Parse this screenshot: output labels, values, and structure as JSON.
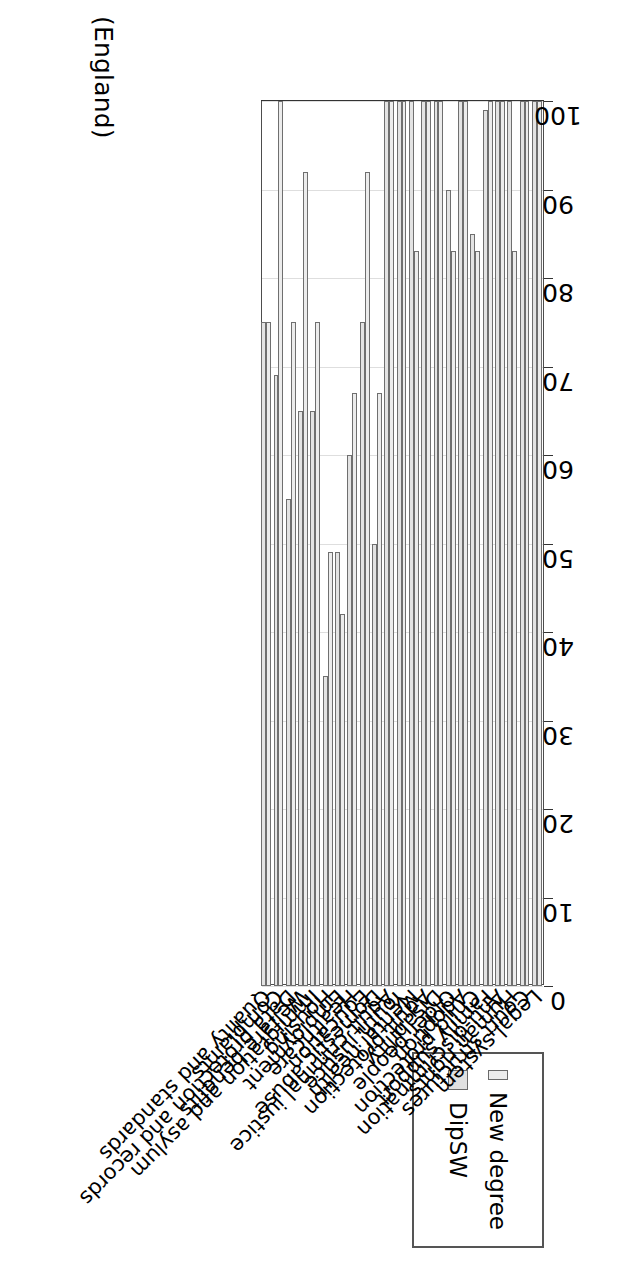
{
  "caption": "(England)",
  "legend": {
    "title": "",
    "items": [
      {
        "label": "New degree",
        "color": "#ececec"
      },
      {
        "label": "DipSW",
        "color": "#e0e0e0"
      }
    ]
  },
  "axis": {
    "tick_labels": [
      "100",
      "90",
      "80",
      "70",
      "60",
      "50",
      "40",
      "30",
      "20",
      "10",
      "0"
    ]
  },
  "chart_data": {
    "type": "bar",
    "orientation": "horizontal",
    "title": "",
    "subtitle": "(England)",
    "xlabel": "",
    "ylabel": "",
    "xlim": [
      0,
      100
    ],
    "grid": true,
    "legend_position": "top-right",
    "categories": [
      "Legal system",
      "Court structures",
      "Human rights",
      "Anti-discrimination",
      "Family support",
      "Child protection",
      "Adoption",
      "Older people",
      "Disability",
      "Adult protection",
      "Mental health",
      "Youth justice",
      "Adult criminal justice",
      "Domestic abuse",
      "Education",
      "Healthcare",
      "Employment",
      "Housing",
      "Immigration and asylum",
      "Welfare benefits",
      "Data protection and records",
      "Complaints",
      "Quality and standards"
    ],
    "series": [
      {
        "name": "New degree",
        "values": [
          100,
          100,
          83,
          100,
          100,
          83,
          100,
          83,
          100,
          100,
          83,
          100,
          100,
          67,
          92,
          67,
          42,
          49,
          75,
          92,
          75,
          100,
          75
        ]
      },
      {
        "name": "DipSW",
        "values": [
          100,
          100,
          100,
          100,
          99,
          85,
          100,
          90,
          100,
          100,
          100,
          100,
          100,
          50,
          75,
          60,
          49,
          35,
          65,
          65,
          55,
          69,
          75
        ]
      }
    ]
  }
}
